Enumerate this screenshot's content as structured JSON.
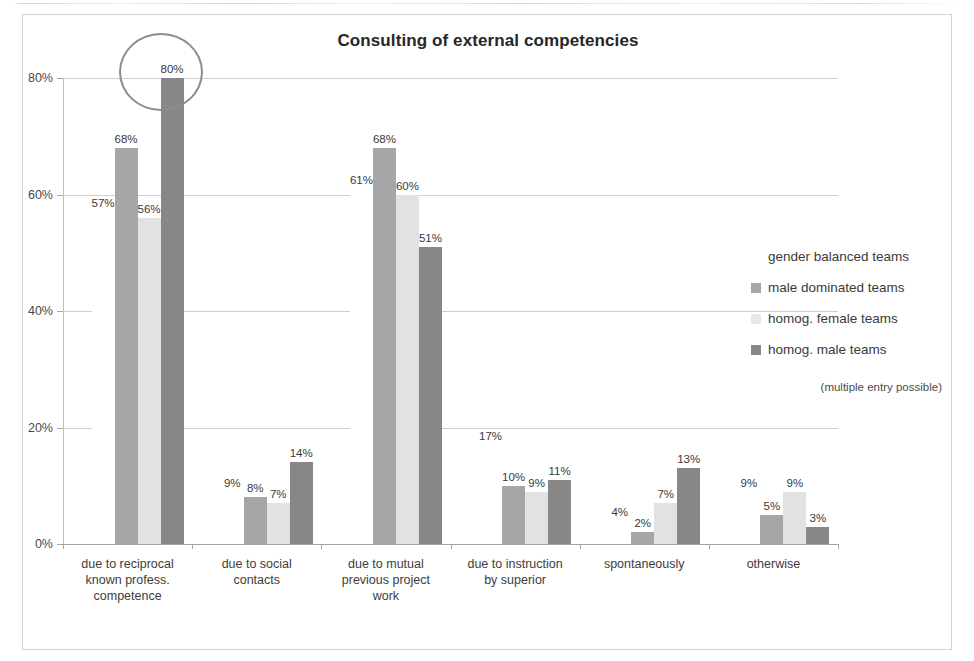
{
  "chart_data": {
    "type": "bar",
    "title": "Consulting of external competencies",
    "xlabel": "",
    "ylabel": "",
    "ylim": [
      0,
      80
    ],
    "grid": true,
    "legend_position": "right",
    "ytick_labels": [
      "0%",
      "20%",
      "40%",
      "60%",
      "80%"
    ],
    "ytick_values": [
      0,
      20,
      40,
      60,
      80
    ],
    "categories": [
      "due to reciprocal known profess. competence",
      "due to social contacts",
      "due to mutual previous project work",
      "due to instruction by superior",
      "spontaneously",
      "otherwise"
    ],
    "category_lines": [
      [
        "due to reciprocal",
        "known profess.",
        "competence"
      ],
      [
        "due to social",
        "contacts"
      ],
      [
        "due to mutual",
        "previous project",
        "work"
      ],
      [
        "due to instruction",
        "by superior"
      ],
      [
        "spontaneously"
      ],
      [
        "otherwise"
      ]
    ],
    "series": [
      {
        "name": "gender balanced teams",
        "color": "#ffffff",
        "bars_visible": false,
        "values": [
          57,
          9,
          61,
          17,
          4,
          9
        ],
        "labels": [
          "57%",
          "9%",
          "61%",
          "17%",
          "4%",
          "9%"
        ]
      },
      {
        "name": "male dominated teams",
        "color": "#a6a6a6",
        "bars_visible": true,
        "values": [
          68,
          8,
          68,
          10,
          2,
          5
        ],
        "labels": [
          "68%",
          "8%",
          "68%",
          "10%",
          "2%",
          "5%"
        ]
      },
      {
        "name": "homog. female teams",
        "color": "#e2e2e2",
        "bars_visible": true,
        "values": [
          56,
          7,
          60,
          9,
          7,
          9
        ],
        "labels": [
          "56%",
          "7%",
          "60%",
          "9%",
          "7%",
          "9%"
        ]
      },
      {
        "name": "homog. male teams",
        "color": "#878787",
        "bars_visible": true,
        "values": [
          80,
          14,
          51,
          11,
          13,
          3
        ],
        "labels": [
          "80%",
          "14%",
          "51%",
          "11%",
          "13%",
          "3%"
        ]
      }
    ],
    "annotations": [
      {
        "type": "ellipse",
        "target": "homog. male teams @ due to reciprocal known profess. competence",
        "value_highlighted": "80%",
        "color": "#8c8c8c"
      }
    ],
    "note": "(multiple entry possible)"
  },
  "legend": {
    "items": [
      {
        "label": "gender balanced teams",
        "swatch": "s0"
      },
      {
        "label": "male dominated teams",
        "swatch": "s1"
      },
      {
        "label": "homog. female teams",
        "swatch": "s2"
      },
      {
        "label": "homog. male teams",
        "swatch": "s3"
      }
    ],
    "note": "(multiple entry possible)"
  }
}
